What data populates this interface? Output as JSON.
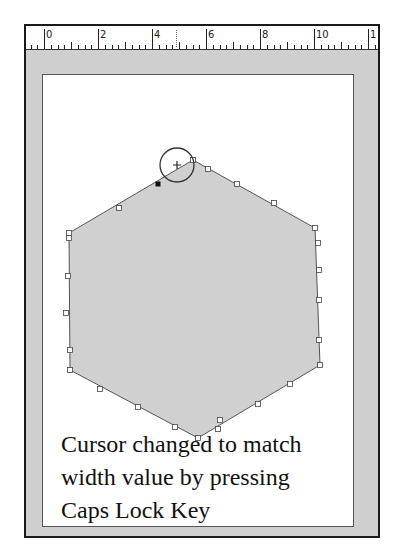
{
  "ruler": {
    "labels": [
      "0",
      "2",
      "4",
      "6",
      "8",
      "10",
      "1"
    ],
    "unit_px": 27,
    "zero_x": 44,
    "cursor_marker_x": 176
  },
  "shape": {
    "type": "hexagon",
    "fill": "#d0d0d0",
    "stroke": "#555555",
    "vertices": [
      [
        193,
        160
      ],
      [
        315,
        228
      ],
      [
        320,
        365
      ],
      [
        198,
        438
      ],
      [
        70,
        370
      ],
      [
        69,
        233
      ]
    ],
    "selected_handle": [
      158,
      184
    ]
  },
  "cursor": {
    "icon": "circle-crosshair-cursor",
    "center": [
      177,
      165
    ],
    "radius": 17
  },
  "caption": {
    "lines": [
      "Cursor changed to match",
      "width value by pressing",
      "Caps Lock Key"
    ]
  }
}
